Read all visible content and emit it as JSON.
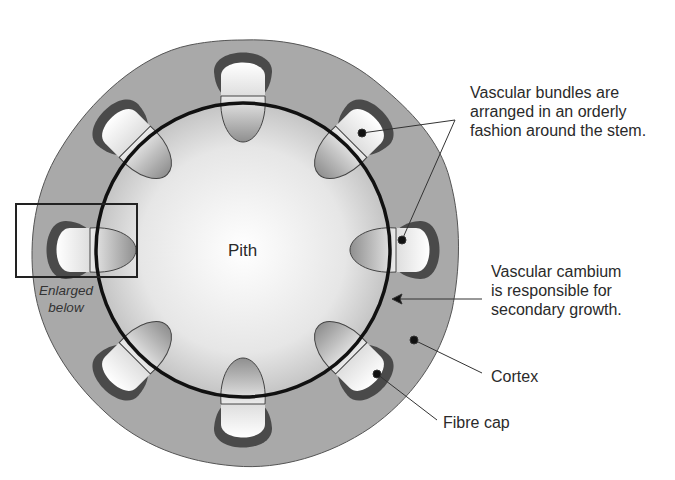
{
  "diagram": {
    "center_label": "Pith",
    "enlarge_caption": [
      "Enlarged",
      "below"
    ],
    "annotations": [
      {
        "id": "vascular-bundles",
        "lines": [
          "Vascular bundles are",
          "arranged in an orderly",
          "fashion around the stem."
        ]
      },
      {
        "id": "vascular-cambium",
        "lines": [
          "Vascular cambium",
          "is responsible for",
          "secondary growth."
        ]
      },
      {
        "id": "cortex",
        "lines": [
          "Cortex"
        ]
      },
      {
        "id": "fibre-cap",
        "lines": [
          "Fibre cap"
        ]
      }
    ],
    "structure": {
      "center": [
        243,
        250
      ],
      "cortex_radius": 210,
      "cambium_radius": 147,
      "bundle_count": 8,
      "bundle_angles_deg": [
        -90,
        -45,
        0,
        45,
        90,
        135,
        180,
        225
      ]
    },
    "colors": {
      "cortex": "#a9a9a9",
      "cortex_edge": "#555555",
      "pith_center": "#ffffff",
      "pith_edge": "#c4c4c4",
      "fibre_cap": "#4a4a4a",
      "phloem": "#f2f2f2",
      "xylem": "#b5b5b5",
      "cambium": "#111111",
      "leader": "#333333"
    }
  }
}
